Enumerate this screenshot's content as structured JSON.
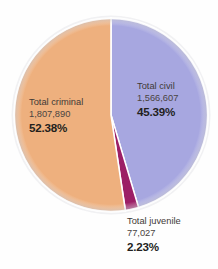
{
  "chart_data": {
    "type": "pie",
    "title": "",
    "background_color": "#fefefe",
    "center": {
      "x": 111,
      "y": 115
    },
    "radius": 97,
    "start_angle_deg": -90,
    "direction": "clockwise",
    "categories": [
      "Total civil",
      "Total criminal",
      "Total juvenile"
    ],
    "values": [
      1566607,
      1807890,
      77027
    ],
    "percentages": [
      45.39,
      52.38,
      2.23
    ],
    "colors": [
      "#a7a7e0",
      "#eeb07e",
      "#9c1f66"
    ],
    "slice_separator_color": "#ffffff",
    "legend": "none",
    "grid": false,
    "slices": [
      {
        "name": "civil",
        "label": "Total civil",
        "value": "1,566,607",
        "percent": "45.39%",
        "color": "#a7a7e0"
      },
      {
        "name": "criminal",
        "label": "Total criminal",
        "value": "1,807,890",
        "percent": "52.38%",
        "color": "#eeb07e"
      },
      {
        "name": "juvenile",
        "label": "Total juvenile",
        "value": "77,027",
        "percent": "2.23%",
        "color": "#9c1f66"
      }
    ]
  }
}
